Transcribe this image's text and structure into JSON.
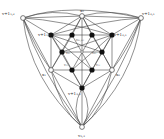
{
  "diagram": {
    "type": "graph",
    "colors": {
      "edge": "#444444",
      "filled_node": "#111111",
      "open_node_fill": "#ffffff",
      "background": "#ffffff"
    },
    "nodes": [
      {
        "id": "tl",
        "x": 23,
        "y": 18,
        "kind": "open",
        "label": "v+1₁,₂",
        "lx": 2,
        "ly": 15
      },
      {
        "id": "top",
        "x": 82,
        "y": 16,
        "kind": "open",
        "label": "x₀",
        "lx": 80,
        "ly": 12
      },
      {
        "id": "tr",
        "x": 141,
        "y": 18,
        "kind": "open",
        "label": "v+1₂,₁",
        "lx": 142,
        "ly": 15
      },
      {
        "id": "a1",
        "x": 51,
        "y": 35,
        "kind": "filled",
        "label": "v+1₁,₂",
        "lx": 38,
        "ly": 36
      },
      {
        "id": "a2",
        "x": 72,
        "y": 35,
        "kind": "filled",
        "label": "",
        "lx": 0,
        "ly": 0
      },
      {
        "id": "a3",
        "x": 92,
        "y": 35,
        "kind": "filled",
        "label": "",
        "lx": 0,
        "ly": 0
      },
      {
        "id": "a4",
        "x": 112,
        "y": 35,
        "kind": "filled",
        "label": "v+1₂,₁",
        "lx": 114,
        "ly": 36
      },
      {
        "id": "b1",
        "x": 62,
        "y": 52,
        "kind": "filled",
        "label": "",
        "lx": 0,
        "ly": 0
      },
      {
        "id": "b2",
        "x": 102,
        "y": 52,
        "kind": "filled",
        "label": "",
        "lx": 0,
        "ly": 0
      },
      {
        "id": "c1",
        "x": 51,
        "y": 70,
        "kind": "open",
        "label": "x₁",
        "lx": 42,
        "ly": 76
      },
      {
        "id": "c2",
        "x": 72,
        "y": 70,
        "kind": "filled",
        "label": "",
        "lx": 0,
        "ly": 0
      },
      {
        "id": "c3",
        "x": 92,
        "y": 70,
        "kind": "filled",
        "label": "",
        "lx": 0,
        "ly": 0
      },
      {
        "id": "c4",
        "x": 112,
        "y": 70,
        "kind": "open",
        "label": "x₂",
        "lx": 116,
        "ly": 76
      },
      {
        "id": "d",
        "x": 82,
        "y": 88,
        "kind": "filled",
        "label": "v+1₃,₃",
        "lx": 68,
        "ly": 95
      },
      {
        "id": "bot",
        "x": 82,
        "y": 127,
        "kind": "open",
        "label": "v₃,₃",
        "lx": 78,
        "ly": 137
      },
      {
        "id": "ctr",
        "x": 82,
        "y": 52,
        "kind": "small",
        "label": "",
        "lx": 0,
        "ly": 0
      }
    ],
    "inner_labels": [
      {
        "text": "v₀₁,₀₂",
        "x": 76,
        "y": 41
      },
      {
        "text": "v₀₁",
        "x": 66,
        "y": 54
      },
      {
        "text": "v₀₂",
        "x": 92,
        "y": 54
      },
      {
        "text": "v₁₂",
        "x": 64,
        "y": 66
      },
      {
        "text": "v₂₁",
        "x": 96,
        "y": 66
      }
    ],
    "edges": [
      [
        "tl",
        "top"
      ],
      [
        "top",
        "tr"
      ],
      [
        "tl",
        "a1"
      ],
      [
        "tr",
        "a4"
      ],
      [
        "top",
        "a1"
      ],
      [
        "top",
        "a4"
      ],
      [
        "top",
        "a2"
      ],
      [
        "top",
        "a3"
      ],
      [
        "top",
        "ctr"
      ],
      [
        "a1",
        "a2"
      ],
      [
        "a2",
        "a3"
      ],
      [
        "a3",
        "a4"
      ],
      [
        "a1",
        "c1"
      ],
      [
        "a4",
        "c4"
      ],
      [
        "c1",
        "c2"
      ],
      [
        "c2",
        "c3"
      ],
      [
        "c3",
        "c4"
      ],
      [
        "a1",
        "b1"
      ],
      [
        "b1",
        "c1"
      ],
      [
        "a4",
        "b2"
      ],
      [
        "b2",
        "c4"
      ],
      [
        "a1",
        "c3"
      ],
      [
        "a4",
        "c2"
      ],
      [
        "a2",
        "c3"
      ],
      [
        "a3",
        "c2"
      ],
      [
        "a1",
        "b2"
      ],
      [
        "a4",
        "b1"
      ],
      [
        "b1",
        "b2"
      ],
      [
        "a2",
        "b1"
      ],
      [
        "a3",
        "b2"
      ],
      [
        "b1",
        "c2"
      ],
      [
        "b2",
        "c3"
      ],
      [
        "c1",
        "d"
      ],
      [
        "c4",
        "d"
      ],
      [
        "c2",
        "d"
      ],
      [
        "c3",
        "d"
      ],
      [
        "d",
        "bot"
      ],
      [
        "ctr",
        "d"
      ],
      [
        "tl",
        "c1"
      ],
      [
        "tr",
        "c4"
      ],
      [
        "c1",
        "bot"
      ],
      [
        "c4",
        "bot"
      ],
      [
        "top",
        "c1"
      ],
      [
        "top",
        "c4"
      ],
      [
        "a1",
        "d"
      ],
      [
        "a4",
        "d"
      ]
    ],
    "curves": [
      "M23,18 Q52,8 82,16",
      "M82,16 Q112,8 141,18",
      "M23,18 Q70,2 141,18",
      "M23,18 Q30,80 82,127",
      "M141,18 Q134,80 82,127",
      "M23,18 Q40,70 82,127",
      "M141,18 Q124,70 82,127",
      "M23,18 Q60,20 112,35",
      "M141,18 Q104,20 51,35",
      "M23,18 Q36,50 51,70",
      "M141,18 Q128,50 112,70",
      "M51,70 Q60,110 82,127",
      "M112,70 Q104,110 82,127",
      "M82,88 Q70,110 82,127",
      "M82,88 Q94,110 82,127"
    ]
  }
}
